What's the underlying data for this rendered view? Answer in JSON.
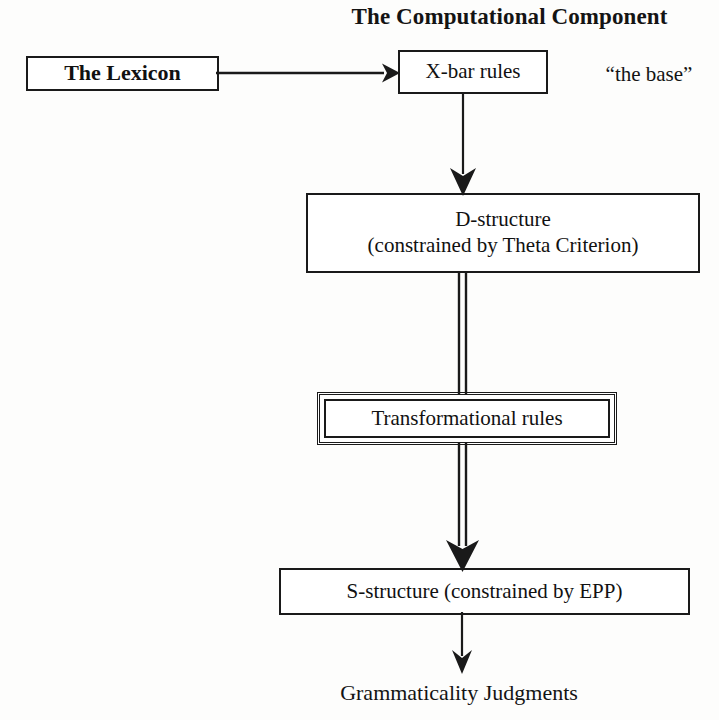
{
  "diagram": {
    "title": "The Computational Component",
    "nodes": {
      "lexicon": {
        "label": "The Lexicon"
      },
      "xbar": {
        "label": "X-bar rules"
      },
      "base_annotation": {
        "label": "“the base”"
      },
      "dstructure": {
        "line1": "D-structure",
        "line2": "(constrained by Theta Criterion)"
      },
      "transformational": {
        "label": "Transformational rules"
      },
      "sstructure": {
        "label": "S-structure (constrained by EPP)"
      },
      "judgments": {
        "label": "Grammaticality Judgments"
      }
    },
    "edges": [
      {
        "name": "lexicon-to-xbar",
        "from": "The Lexicon",
        "to": "X-bar rules",
        "style": "single-line-arrow",
        "direction": "right"
      },
      {
        "name": "xbar-to-dstructure",
        "from": "X-bar rules",
        "to": "D-structure",
        "style": "single-line-arrow",
        "direction": "down"
      },
      {
        "name": "dstructure-to-transformational",
        "from": "D-structure",
        "to": "Transformational rules",
        "style": "double-line",
        "direction": "down"
      },
      {
        "name": "transformational-to-sstructure",
        "from": "Transformational rules",
        "to": "S-structure",
        "style": "double-line-arrow",
        "direction": "down"
      },
      {
        "name": "sstructure-to-judgments",
        "from": "S-structure",
        "to": "Grammaticality Judgments",
        "style": "single-line-arrow",
        "direction": "down"
      }
    ],
    "colors": {
      "ink": "#1a1a1a",
      "background": "#fdfdfc",
      "text": "#111111"
    }
  }
}
